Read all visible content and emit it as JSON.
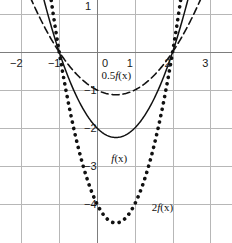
{
  "chart_data": {
    "type": "line",
    "title": "",
    "xlabel": "",
    "ylabel": "",
    "xlim": [
      -2.55,
      3.25
    ],
    "ylim": [
      -4.85,
      1.35
    ],
    "grid": true,
    "grid_spacing": 1,
    "legend_position": "inline-annotations",
    "x_ticks": [
      -2,
      -1,
      0,
      1,
      2,
      3
    ],
    "y_ticks": [
      1,
      -1,
      -2,
      -3,
      -4
    ],
    "roots": [
      -1,
      2
    ],
    "series": [
      {
        "name": "0.5f(x)",
        "label": "0.5f(x)",
        "style": "dashed",
        "formula": "0.5*(x*x - x - 2)",
        "vertex": [
          0.5,
          -1.125
        ],
        "color": "#111111",
        "x": [
          -1.6,
          -1.4,
          -1.2,
          -1.0,
          -0.8,
          -0.6,
          -0.4,
          -0.2,
          0.0,
          0.2,
          0.4,
          0.5,
          0.6,
          0.8,
          1.0,
          1.2,
          1.4,
          1.6,
          1.8,
          2.0,
          2.2,
          2.4,
          2.6
        ],
        "values": [
          1.58,
          1.18,
          0.82,
          0.5,
          0.22,
          -0.02,
          -0.22,
          -0.38,
          -1.0,
          -1.08,
          -1.12,
          -1.125,
          -1.12,
          -1.08,
          -1.0,
          -0.88,
          -0.72,
          -0.52,
          -0.28,
          0.0,
          0.32,
          0.68,
          1.08
        ]
      },
      {
        "name": "f(x)",
        "label": "f(x)",
        "style": "solid",
        "formula": "x*x - x - 2",
        "vertex": [
          0.5,
          -2.25
        ],
        "color": "#111111",
        "x": [
          -1.4,
          -1.2,
          -1.0,
          -0.8,
          -0.6,
          -0.4,
          -0.2,
          0.0,
          0.2,
          0.4,
          0.5,
          0.6,
          0.8,
          1.0,
          1.2,
          1.4,
          1.6,
          1.8,
          2.0,
          2.2,
          2.4
        ],
        "values": [
          2.36,
          1.64,
          0.0,
          -0.56,
          -1.04,
          -1.44,
          -1.76,
          -2.0,
          -2.16,
          -2.24,
          -2.25,
          -2.24,
          -2.16,
          -2.0,
          -1.76,
          -1.44,
          -1.04,
          -0.56,
          0.0,
          0.64,
          1.36
        ]
      },
      {
        "name": "2f(x)",
        "label": "2f(x)",
        "style": "dotted",
        "formula": "2*(x*x - x - 2)",
        "vertex": [
          0.5,
          -4.5
        ],
        "color": "#111111",
        "x": [
          -1.2,
          -1.0,
          -0.8,
          -0.6,
          -0.4,
          -0.2,
          0.0,
          0.2,
          0.4,
          0.5,
          0.6,
          0.8,
          1.0,
          1.2,
          1.4,
          1.6,
          1.8,
          2.0,
          2.2
        ],
        "values": [
          3.28,
          0.0,
          -1.12,
          -2.08,
          -2.88,
          -3.52,
          -4.0,
          -4.32,
          -4.48,
          -4.5,
          -4.48,
          -4.32,
          -4.0,
          -3.52,
          -2.88,
          -2.08,
          -1.12,
          0.0,
          1.28
        ]
      }
    ],
    "annotations": [
      {
        "text": "0.5f(x)",
        "prefix": "0.5",
        "italic": "f",
        "suffix": "(x)",
        "x": 0.12,
        "y": -0.62
      },
      {
        "text": "f(x)",
        "prefix": "",
        "italic": "f",
        "suffix": "(x)",
        "x": 0.38,
        "y": -2.82
      },
      {
        "text": "2f(x)",
        "prefix": "2",
        "italic": "f",
        "suffix": "(x)",
        "x": 1.45,
        "y": -4.1
      }
    ],
    "colors": {
      "grid": "#b7b7b7",
      "axis": "#7d7d7d",
      "curve": "#111111",
      "background": "#ffffff",
      "text": "#1a1a1a"
    }
  },
  "tick_labels": {
    "x": [
      {
        "text": "−2",
        "value": -2
      },
      {
        "text": "−1",
        "value": -1
      },
      {
        "text": "0",
        "value": 0
      },
      {
        "text": "1",
        "value": 1
      },
      {
        "text": "2",
        "value": 2
      },
      {
        "text": "3",
        "value": 3
      }
    ],
    "y": [
      {
        "text": "1",
        "value": 1
      },
      {
        "text": "−1",
        "value": -1
      },
      {
        "text": "−2",
        "value": -2
      },
      {
        "text": "−3",
        "value": -3
      },
      {
        "text": "−4",
        "value": -4
      }
    ]
  }
}
